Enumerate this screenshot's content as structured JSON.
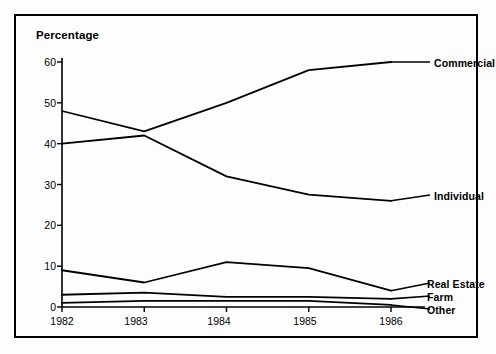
{
  "chart_data": {
    "type": "line",
    "title": "",
    "ylabel": "Percentage",
    "xlabel": "",
    "ylim": [
      0,
      60
    ],
    "yticks": [
      0,
      10,
      20,
      30,
      40,
      50,
      60
    ],
    "grid": false,
    "legend_position": "right-inline-labels",
    "categories": [
      "1982",
      "1983",
      "1984",
      "1985",
      "1986"
    ],
    "x": [
      1982,
      1983,
      1984,
      1985,
      1986
    ],
    "series": [
      {
        "name": "Commercial",
        "values": [
          48,
          43,
          50,
          58,
          60
        ]
      },
      {
        "name": "Individual",
        "values": [
          40,
          42,
          32,
          27.5,
          26
        ]
      },
      {
        "name": "Real Estate",
        "values": [
          9,
          6,
          11,
          9.5,
          4
        ]
      },
      {
        "name": "Farm",
        "values": [
          3,
          3.5,
          2.5,
          2.5,
          2
        ]
      },
      {
        "name": "Other",
        "values": [
          1,
          1.5,
          1.5,
          1.5,
          0.5
        ]
      }
    ],
    "line_color": "#000000",
    "background_color": "#fdfdfd"
  },
  "axis": {
    "y_title": "Percentage",
    "y_tick_labels": [
      "60",
      "50",
      "40",
      "30",
      "20",
      "10",
      "0"
    ],
    "x_tick_labels": [
      "1982",
      "1983",
      "1984",
      "1985",
      "1986"
    ]
  },
  "labels": {
    "commercial": "Commercial",
    "individual": "Individual",
    "real_estate": "Real Estate",
    "farm": "Farm",
    "other": "Other"
  }
}
